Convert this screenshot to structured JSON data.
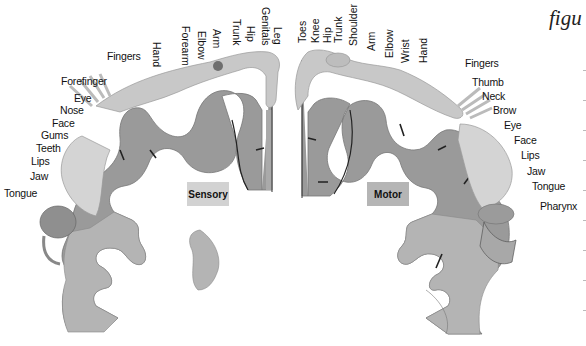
{
  "figure": {
    "caption_fragment": "figu",
    "panels": [
      {
        "name": "Sensory",
        "color": "#cfcfcf"
      },
      {
        "name": "Motor",
        "color": "#b3b3b3"
      }
    ]
  },
  "sensory": {
    "title": "Sensory",
    "top_labels": [
      "Hand",
      "Forearm",
      "Elbow",
      "Arm",
      "Trunk",
      "Hip",
      "Genitals",
      "Leg"
    ],
    "side_labels": [
      "Fingers",
      "Forefinger",
      "Eye",
      "Nose",
      "Face",
      "Gums",
      "Teeth",
      "Lips",
      "Jaw",
      "Tongue"
    ]
  },
  "motor": {
    "title": "Motor",
    "top_labels": [
      "Toes",
      "Knee",
      "Hip",
      "Trunk",
      "Shoulder",
      "Arm",
      "Elbow",
      "Wrist",
      "Hand"
    ],
    "side_labels": [
      "Fingers",
      "Thumb",
      "Neck",
      "Brow",
      "Eye",
      "Face",
      "Lips",
      "Jaw",
      "Tongue",
      "Pharynx"
    ]
  },
  "colors": {
    "cortex_dark": "#8a8a8a",
    "cortex_light": "#b4b4b4",
    "skin": "#c9c9c9",
    "sulcus": "#222222"
  }
}
